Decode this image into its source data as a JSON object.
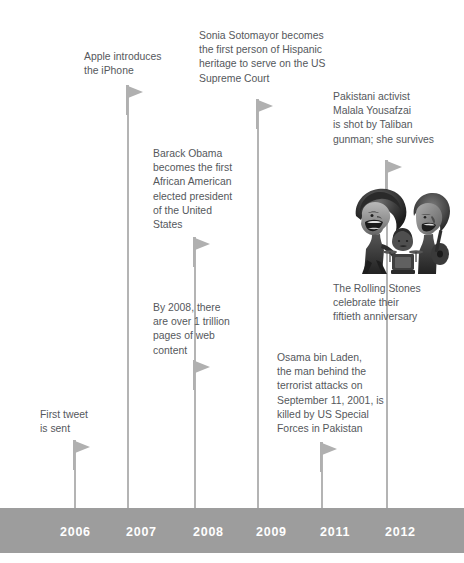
{
  "timeline": {
    "axis": {
      "bar_color": "#9d9d9d",
      "stem_color": "#b4b4b4",
      "marker_color": "#b0b0b0",
      "text_color": "#55585c",
      "year_label_color": "#ffffff"
    },
    "years": [
      {
        "label": "2006",
        "x": 60
      },
      {
        "label": "2007",
        "x": 126
      },
      {
        "label": "2008",
        "x": 193
      },
      {
        "label": "2009",
        "x": 256
      },
      {
        "label": "2011",
        "x": 320
      },
      {
        "label": "2012",
        "x": 385
      }
    ],
    "events": [
      {
        "id": "first-tweet",
        "year": "2006",
        "text": "First tweet\nis sent",
        "text_x": 40,
        "text_y": 408,
        "flag_x": 73,
        "flag_y": 440,
        "stem_x": 74,
        "stem_top": 440,
        "stem_bottom": 508
      },
      {
        "id": "apple-iphone",
        "year": "2007",
        "text": "Apple introduces\nthe iPhone",
        "text_x": 84,
        "text_y": 50,
        "flag_x": 126,
        "flag_y": 85,
        "stem_x": 127,
        "stem_top": 85,
        "stem_bottom": 508
      },
      {
        "id": "barack-obama",
        "year": "2008",
        "text": "Barack Obama\nbecomes the first\nAfrican American\nelected president\nof the United\nStates",
        "text_x": 153,
        "text_y": 147,
        "flag_x": 193,
        "flag_y": 237,
        "stem_x": 194,
        "stem_top": 237,
        "stem_bottom": 508
      },
      {
        "id": "web-pages-trillion",
        "year": "2008",
        "text": "By 2008, there\nare over 1 trillion\npages of web\ncontent",
        "text_x": 153,
        "text_y": 301,
        "flag_x": 193,
        "flag_y": 360,
        "stem_x": 194,
        "stem_top": 360,
        "stem_bottom": 508
      },
      {
        "id": "sonia-sotomayor",
        "year": "2009",
        "text": "Sonia Sotomayor becomes\nthe first person of Hispanic\nheritage to serve on the US\nSupreme Court",
        "text_x": 199,
        "text_y": 29,
        "flag_x": 256,
        "flag_y": 99,
        "stem_x": 257,
        "stem_top": 99,
        "stem_bottom": 508
      },
      {
        "id": "osama-bin-laden",
        "year": "2011",
        "text": "Osama bin Laden,\nthe man behind the\nterrorist attacks on\nSeptember 11, 2001, is\nkilled by US Special\nForces in Pakistan",
        "text_x": 277,
        "text_y": 351,
        "flag_x": 320,
        "flag_y": 442,
        "stem_x": 321,
        "stem_top": 442,
        "stem_bottom": 508
      },
      {
        "id": "malala-yousafzai",
        "year": "2012",
        "text": "Pakistani activist\nMalala Yousafzai\nis shot by Taliban\ngunman; she survives",
        "text_x": 333,
        "text_y": 90,
        "flag_x": 385,
        "flag_y": 160,
        "stem_x": 386,
        "stem_top": 160,
        "stem_bottom": 508
      },
      {
        "id": "rolling-stones",
        "year": "2012",
        "text": "The Rolling Stones\ncelebrate their\nfiftieth anniversary",
        "text_x": 333,
        "text_y": 282,
        "flag_x": null,
        "flag_y": null,
        "stem_x": null,
        "stem_top": null,
        "stem_bottom": null
      }
    ],
    "illustration": {
      "id": "rolling-stones-caricature",
      "alt": "Rolling Stones caricature",
      "x": 352,
      "y": 186,
      "width": 100,
      "height": 88
    },
    "bar": {
      "top": 508,
      "height": 45
    },
    "year_label_y": 525
  }
}
